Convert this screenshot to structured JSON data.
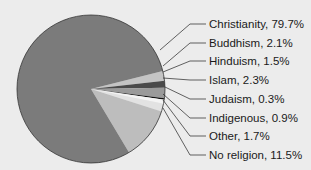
{
  "chart_data": {
    "type": "pie",
    "title": "",
    "categories": [
      "Christianity",
      "Buddhism",
      "Hinduism",
      "Islam",
      "Judaism",
      "Indigenous",
      "Other",
      "No religion"
    ],
    "values": [
      79.7,
      2.1,
      1.5,
      2.3,
      0.3,
      0.9,
      1.7,
      11.5
    ],
    "unit": "%",
    "labels": [
      "Christianity, 79.7%",
      "Buddhism, 2.1%",
      "Hinduism, 1.5%",
      "Islam, 2.3%",
      "Judaism, 0.3%",
      "Indigenous, 0.9%",
      "Other, 1.7%",
      "No religion, 11.5%"
    ],
    "colors": [
      "#7b7b7b",
      "#c4c4c4",
      "#4a4a4a",
      "#9a9a9a",
      "#111111",
      "#f4f4f4",
      "#e2e2e2",
      "#bdbdbd"
    ],
    "legend_position": "right, callout leader lines"
  }
}
